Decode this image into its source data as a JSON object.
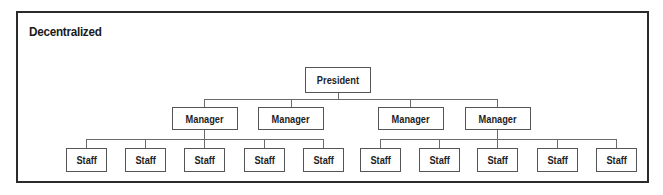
{
  "diagram": {
    "title": "Decentralized",
    "type": "org-chart",
    "root": {
      "label": "President"
    },
    "managers": [
      {
        "label": "Manager"
      },
      {
        "label": "Manager"
      },
      {
        "label": "Manager"
      },
      {
        "label": "Manager"
      }
    ],
    "staff": [
      {
        "label": "Staff",
        "manager": 0
      },
      {
        "label": "Staff",
        "manager": 0
      },
      {
        "label": "Staff",
        "manager": 0
      },
      {
        "label": "Staff",
        "manager": 0
      },
      {
        "label": "Staff",
        "manager": 0
      },
      {
        "label": "Staff",
        "manager": 3
      },
      {
        "label": "Staff",
        "manager": 3
      },
      {
        "label": "Staff",
        "manager": 3
      },
      {
        "label": "Staff",
        "manager": 3
      },
      {
        "label": "Staff",
        "manager": 3
      }
    ],
    "colors": {
      "border": "#2b2b2b",
      "line": "#6a6a6a",
      "text": "#1e1e1e",
      "background": "#ffffff"
    }
  }
}
